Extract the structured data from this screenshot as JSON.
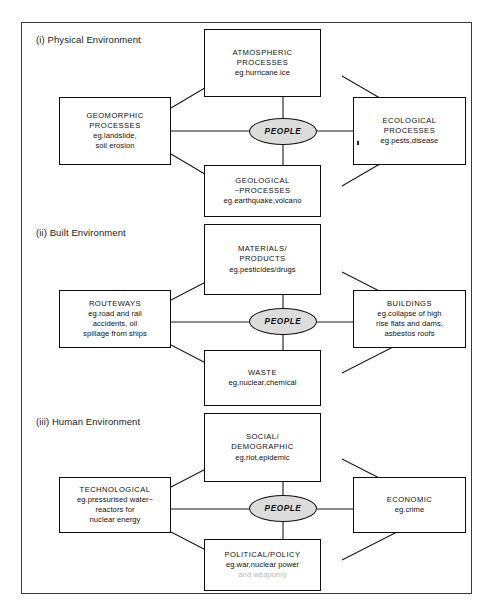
{
  "figure": {
    "center_label": "PEOPLE",
    "colors": {
      "frame": "#3a3a3a",
      "box_border": "#0d0d0d",
      "connector": "#1a1a1a",
      "people_fill": "#dcdcdc",
      "faded_text": "#b9b9b9",
      "background": "#ffffff"
    }
  },
  "sections": [
    {
      "title": "(i) Physical Environment",
      "center": "PEOPLE",
      "nodes": {
        "top": {
          "name": "atmospheric-processes",
          "heading_line1": "ATMOSPHERIC",
          "heading_line2": "PROCESSES",
          "example": "eg.hurricane.ice"
        },
        "left": {
          "name": "geomorphic-processes",
          "heading_line1": "GEOMORPHIC",
          "heading_line2": "PROCESSES",
          "example_line1": "eg.landslide,",
          "example_line2": "soil erosion"
        },
        "right": {
          "name": "ecological-processes",
          "heading_line1": "ECOLOGICAL",
          "heading_line2": "PROCESSES",
          "example": "eg.pests,disease"
        },
        "bottom": {
          "name": "geological-processes",
          "heading_line1": "GEOLOGICAL",
          "heading_line2": "~PROCESSES",
          "example": "eg.earthquake,volcano"
        }
      }
    },
    {
      "title": "(ii) Built Environment",
      "center": "PEOPLE",
      "nodes": {
        "top": {
          "name": "materials-products",
          "heading_line1": "MATERIALS/",
          "heading_line2": "PRODUCTS",
          "example": "eg.pesticides/drugs"
        },
        "left": {
          "name": "routeways",
          "heading_line1": "ROUTEWAYS",
          "example_line1": "eg.road and rail",
          "example_line2": "accidents, oil",
          "example_line3": "spillage from ships"
        },
        "right": {
          "name": "buildings",
          "heading_line1": "BUILDINGS",
          "example_line1": "eg.collapse of high",
          "example_line2": "rise flats and dams,",
          "example_line3": "asbestos roofs"
        },
        "bottom": {
          "name": "waste",
          "heading_line1": "WASTE",
          "example": "eg.nuclear,chemical"
        }
      }
    },
    {
      "title": "(iii) Human Environment",
      "center": "PEOPLE",
      "nodes": {
        "top": {
          "name": "social-demographic",
          "heading_line1": "SOCIAL/",
          "heading_line2": "DEMOGRAPHIC",
          "example": "eg.riot,epidemic"
        },
        "left": {
          "name": "technological",
          "heading_line1": "TECHNOLOGICAL",
          "example_line1": "eg.pressurised water~",
          "example_line2": "reactors for",
          "example_line3": "nuclear energy"
        },
        "right": {
          "name": "economic",
          "heading_line1": "ECONOMIC",
          "example": "eg.crime"
        },
        "bottom": {
          "name": "political-policy",
          "heading_line1": "POLITICAL/POLICY",
          "example_line1": "eg.war,nuclear power",
          "example_line2": "and weaponry"
        }
      }
    }
  ]
}
